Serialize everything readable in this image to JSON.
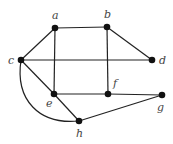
{
  "graph": {
    "nodes": [
      {
        "id": "a",
        "label": "a",
        "x": 55,
        "y": 28,
        "lx": 52,
        "ly": 19
      },
      {
        "id": "b",
        "label": "b",
        "x": 107,
        "y": 27,
        "lx": 104,
        "ly": 18
      },
      {
        "id": "c",
        "label": "c",
        "x": 21,
        "y": 60,
        "lx": 8,
        "ly": 64
      },
      {
        "id": "d",
        "label": "d",
        "x": 152,
        "y": 60,
        "lx": 159,
        "ly": 64
      },
      {
        "id": "e",
        "label": "e",
        "x": 54,
        "y": 94,
        "lx": 46,
        "ly": 107
      },
      {
        "id": "f",
        "label": "f",
        "x": 108,
        "y": 94,
        "lx": 113,
        "ly": 87
      },
      {
        "id": "g",
        "label": "g",
        "x": 162,
        "y": 95,
        "lx": 157,
        "ly": 111
      },
      {
        "id": "h",
        "label": "h",
        "x": 79,
        "y": 121,
        "lx": 76,
        "ly": 137
      }
    ],
    "edges": [
      {
        "from": "a",
        "to": "b"
      },
      {
        "from": "b",
        "to": "d"
      },
      {
        "from": "c",
        "to": "a"
      },
      {
        "from": "c",
        "to": "d"
      },
      {
        "from": "a",
        "to": "e"
      },
      {
        "from": "b",
        "to": "f"
      },
      {
        "from": "c",
        "to": "e"
      },
      {
        "from": "e",
        "to": "f"
      },
      {
        "from": "f",
        "to": "g"
      },
      {
        "from": "e",
        "to": "h"
      },
      {
        "from": "h",
        "to": "g"
      },
      {
        "from": "c",
        "to": "h",
        "curved": true
      }
    ]
  }
}
